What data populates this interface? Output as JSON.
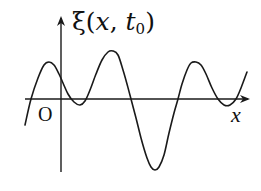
{
  "figure": {
    "y_label": {
      "symbol": "ξ",
      "open": "(",
      "var_x": "x",
      "comma": ", ",
      "var_t": "t",
      "subscript": "0",
      "close": ")"
    },
    "x_label": "x",
    "origin_label": "O",
    "colors": {
      "line": "#1a1a1a",
      "background": "#ffffff"
    },
    "axes": {
      "x_axis": {
        "y": 99,
        "x_start": 25,
        "x_end": 248
      },
      "y_axis": {
        "x": 61,
        "y_start": 172,
        "y_end": 18
      }
    },
    "curve_points": [
      [
        25,
        125
      ],
      [
        31,
        99
      ],
      [
        38,
        78
      ],
      [
        44,
        65
      ],
      [
        49,
        62
      ],
      [
        54,
        65
      ],
      [
        59,
        74
      ],
      [
        63,
        83
      ],
      [
        68,
        94
      ],
      [
        74,
        102
      ],
      [
        80,
        105
      ],
      [
        85,
        101
      ],
      [
        90,
        90
      ],
      [
        96,
        74
      ],
      [
        102,
        60
      ],
      [
        108,
        52
      ],
      [
        113,
        51
      ],
      [
        118,
        55
      ],
      [
        123,
        70
      ],
      [
        127,
        84
      ],
      [
        131,
        99
      ],
      [
        136,
        118
      ],
      [
        141,
        138
      ],
      [
        147,
        158
      ],
      [
        151,
        167
      ],
      [
        155,
        170
      ],
      [
        159,
        167
      ],
      [
        164,
        155
      ],
      [
        169,
        133
      ],
      [
        174,
        113
      ],
      [
        178,
        99
      ],
      [
        182,
        84
      ],
      [
        187,
        70
      ],
      [
        191,
        63
      ],
      [
        196,
        62
      ],
      [
        201,
        65
      ],
      [
        206,
        74
      ],
      [
        212,
        88
      ],
      [
        218,
        99
      ],
      [
        224,
        105
      ],
      [
        230,
        105
      ],
      [
        236,
        99
      ],
      [
        241,
        88
      ],
      [
        247,
        72
      ]
    ]
  }
}
